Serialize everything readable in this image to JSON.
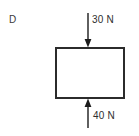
{
  "diagram": {
    "option_label": "D",
    "type": "free-body-diagram",
    "body": {
      "shape": "rectangle",
      "fill": "#ffffff",
      "stroke": "#2b2b2b",
      "stroke_width": 2,
      "x": 56,
      "y": 48,
      "width": 68,
      "height": 50
    },
    "forces": [
      {
        "id": "top-force",
        "label": "30 N",
        "magnitude": 30,
        "unit": "N",
        "direction": "down",
        "applied_at": "top-edge",
        "color": "#1c1c1c",
        "line_x": 88,
        "tail_y": 13,
        "tip_y": 47
      },
      {
        "id": "bottom-force",
        "label": "40 N",
        "magnitude": 40,
        "unit": "N",
        "direction": "up",
        "applied_at": "bottom-edge",
        "color": "#1c1c1c",
        "line_x": 88,
        "tail_y": 128,
        "tip_y": 99
      }
    ]
  }
}
